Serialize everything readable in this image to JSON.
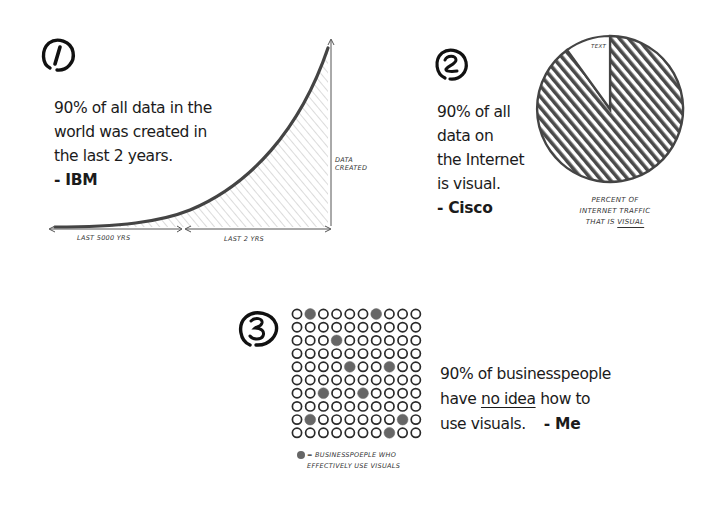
{
  "facts": [
    {
      "number": "1",
      "statement_lines": [
        "90% of all data in the",
        "world was created in",
        "the last 2 years."
      ],
      "attribution": "- IBM",
      "chart": {
        "y_axis_label_lines": [
          "DATA",
          "CREATED"
        ],
        "x_segment_left": "LAST 5000 YRS",
        "x_segment_right": "LAST 2 YRS"
      }
    },
    {
      "number": "2",
      "statement_lines": [
        "90% of all",
        "data on",
        "the Internet",
        "is visual."
      ],
      "attribution": "- Cisco",
      "chart": {
        "slice_label": "TEXT",
        "caption_lines": [
          "PERCENT OF",
          "INTERNET TRAFFIC"
        ],
        "caption_last_prefix": "THAT IS",
        "caption_last_emph": "VISUAL"
      }
    },
    {
      "number": "3",
      "statement_line1": "90% of businesspeople",
      "statement_line2_pre": "have",
      "statement_line2_emph": "no idea",
      "statement_line2_post": "how to",
      "statement_line3": "use visuals.",
      "attribution": "- Me",
      "chart": {
        "legend_lines": [
          "= BUSINESSPOEPLE WHO",
          "EFFECTIVELY USE VISUALS"
        ]
      }
    }
  ],
  "chart_data": [
    {
      "type": "area",
      "title": "",
      "xlabel": "",
      "ylabel": "DATA CREATED",
      "x_segments": [
        "LAST 5000 YRS",
        "LAST 2 YRS"
      ],
      "description": "Exponential curve: near-zero over last 5000 years, rising steeply across last 2 years (hatched area under curve).",
      "x": [
        0,
        0.1,
        0.2,
        0.3,
        0.4,
        0.5,
        0.6,
        0.7,
        0.8,
        0.9,
        1.0
      ],
      "values": [
        0.0,
        0.002,
        0.005,
        0.01,
        0.03,
        0.07,
        0.16,
        0.3,
        0.5,
        0.73,
        1.0
      ],
      "grid": false
    },
    {
      "type": "pie",
      "title": "PERCENT OF INTERNET TRAFFIC THAT IS VISUAL",
      "categories": [
        "VISUAL",
        "TEXT"
      ],
      "values": [
        90,
        10
      ],
      "colors": [
        "#444444",
        "#ffffff"
      ]
    },
    {
      "type": "heatmap",
      "title": "BUSINESSPEOPLE WHO EFFECTIVELY USE VISUALS",
      "rows": 10,
      "cols": 10,
      "filled_cells": [
        [
          0,
          1
        ],
        [
          0,
          6
        ],
        [
          2,
          3
        ],
        [
          4,
          4
        ],
        [
          4,
          7
        ],
        [
          6,
          2
        ],
        [
          6,
          5
        ],
        [
          8,
          1
        ],
        [
          8,
          8
        ],
        [
          9,
          7
        ]
      ],
      "filled_count": 10,
      "total": 100,
      "filled_color": "#666666",
      "empty_style": "outlined circle"
    }
  ]
}
